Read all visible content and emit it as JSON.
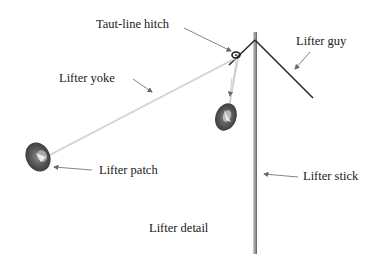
{
  "diagram": {
    "title": "Lifter detail",
    "labels": {
      "taut_line_hitch": "Taut-line hitch",
      "lifter_guy": "Lifter guy",
      "lifter_yoke": "Lifter yoke",
      "lifter_patch": "Lifter patch",
      "lifter_stick": "Lifter stick",
      "caption": "Lifter detail"
    },
    "colors": {
      "stick": "#8a8a8a",
      "guy_line": "#2a2a2a",
      "yoke_line": "#c8c8c8",
      "patch": "#555555",
      "arrow": "#777777",
      "text": "#1a1a1a"
    }
  }
}
